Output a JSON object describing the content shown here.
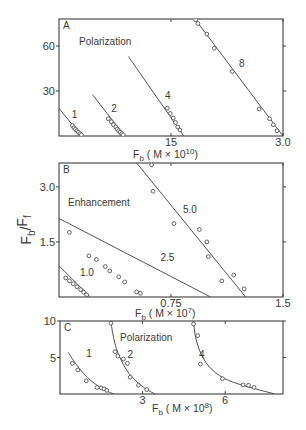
{
  "figure": {
    "ylabel": "Fb/Ff",
    "ylabel_parts": {
      "num": "F",
      "num_sub": "b",
      "den": "F",
      "den_sub": "f"
    }
  },
  "chart_data": [
    {
      "panel": "A",
      "type": "scatter",
      "title": "Polarization",
      "xlabel": "Fb (M x 10^10)",
      "xlabel_parts": {
        "main": "F",
        "sub": "b",
        "rest": "( M × 10",
        "exp": "10",
        "close": ")"
      },
      "ylabel": "Fb/Ff",
      "xlim": [
        0,
        30
      ],
      "ylim": [
        0,
        78
      ],
      "xticks": [
        {
          "v": 15,
          "label": "15"
        },
        {
          "v": 30,
          "label": "3.0"
        }
      ],
      "yticks": [
        {
          "v": 30,
          "label": "30"
        },
        {
          "v": 60,
          "label": "60"
        }
      ],
      "fit": "linear",
      "series": [
        {
          "name": "1",
          "line": [
            [
              0,
              18.5
            ],
            [
              3.0,
              0
            ]
          ],
          "label_at": [
            1.7,
            12
          ],
          "points": [
            [
              1.8,
              7
            ],
            [
              2.0,
              5.5
            ],
            [
              2.2,
              4.5
            ],
            [
              2.4,
              3.5
            ],
            [
              2.6,
              2.5
            ],
            [
              2.8,
              1.5
            ],
            [
              3.0,
              0.8
            ]
          ]
        },
        {
          "name": "2",
          "line": [
            [
              4.5,
              27.5
            ],
            [
              8.8,
              0
            ]
          ],
          "label_at": [
            7.0,
            16
          ],
          "points": [
            [
              6.6,
              11.5
            ],
            [
              7.0,
              9.5
            ],
            [
              7.3,
              7.5
            ],
            [
              7.6,
              6
            ],
            [
              7.8,
              4.5
            ],
            [
              8.0,
              3.5
            ],
            [
              8.2,
              2.5
            ],
            [
              8.4,
              1.5
            ],
            [
              8.6,
              0.8
            ]
          ]
        },
        {
          "name": "4",
          "line": [
            [
              9.3,
              53
            ],
            [
              16.7,
              0
            ]
          ],
          "label_at": [
            14.2,
            25
          ],
          "points": [
            [
              14.5,
              18.5
            ],
            [
              14.9,
              15
            ],
            [
              15.3,
              12
            ],
            [
              15.6,
              9
            ],
            [
              15.9,
              6
            ],
            [
              16.2,
              4
            ]
          ]
        },
        {
          "name": "8",
          "line": [
            [
              18.2,
              78
            ],
            [
              30.0,
              0
            ]
          ],
          "label_at": [
            24.1,
            46
          ],
          "points": [
            [
              18.3,
              77.5
            ],
            [
              18.6,
              75
            ],
            [
              19.8,
              68
            ],
            [
              20.8,
              58.5
            ],
            [
              23.2,
              43
            ],
            [
              26.8,
              18
            ],
            [
              28.2,
              11.5
            ],
            [
              28.7,
              7.5
            ],
            [
              29.2,
              3.5
            ]
          ]
        }
      ]
    },
    {
      "panel": "B",
      "type": "scatter",
      "title": "Enhancement",
      "xlabel": "Fb (M x 10^7)",
      "xlabel_parts": {
        "main": "F",
        "sub": "b",
        "rest": "( M × 10",
        "exp": "7",
        "close": ")"
      },
      "ylabel": "Fb/Ff",
      "xlim": [
        0,
        1.5
      ],
      "ylim": [
        0,
        3.65
      ],
      "xticks": [
        {
          "v": 0.75,
          "label": "0.75"
        },
        {
          "v": 1.5,
          "label": "1.5"
        }
      ],
      "yticks": [
        {
          "v": 1.5,
          "label": "1.5"
        },
        {
          "v": 3.0,
          "label": "3.0"
        }
      ],
      "fit": "linear",
      "series": [
        {
          "name": "1.0",
          "line": [
            [
              0,
              0.85
            ],
            [
              0.21,
              0
            ]
          ],
          "label_at": [
            0.14,
            0.58
          ],
          "points": [
            [
              0.045,
              0.52
            ],
            [
              0.07,
              0.44
            ],
            [
              0.095,
              0.36
            ],
            [
              0.12,
              0.28
            ],
            [
              0.145,
              0.2
            ],
            [
              0.165,
              0.13
            ],
            [
              0.185,
              0.06
            ]
          ]
        },
        {
          "name": "2.5",
          "line": [
            [
              0,
              2.14
            ],
            [
              1.015,
              0
            ]
          ],
          "label_at": [
            0.68,
            0.98
          ],
          "points": [
            [
              0.07,
              1.76
            ],
            [
              0.2,
              1.12
            ],
            [
              0.25,
              1.02
            ],
            [
              0.31,
              0.83
            ],
            [
              0.34,
              0.71
            ],
            [
              0.4,
              0.55
            ],
            [
              0.44,
              0.41
            ],
            [
              0.52,
              0.14
            ],
            [
              0.545,
              0.1
            ]
          ]
        },
        {
          "name": "5.0",
          "line": [
            [
              0.52,
              3.65
            ],
            [
              1.25,
              0
            ]
          ],
          "label_at": [
            0.83,
            2.3
          ],
          "points": [
            [
              0.62,
              3.6
            ],
            [
              0.63,
              2.88
            ],
            [
              0.77,
              2.0
            ],
            [
              0.94,
              1.84
            ],
            [
              0.99,
              1.5
            ],
            [
              1.0,
              1.1
            ],
            [
              1.09,
              0.44
            ],
            [
              1.17,
              0.6
            ],
            [
              1.24,
              0.22
            ]
          ]
        }
      ]
    },
    {
      "panel": "C",
      "type": "scatter",
      "title": "Polarization",
      "xlabel": "Fb (M x 10^8)",
      "xlabel_parts": {
        "main": "F",
        "sub": "b",
        "rest": "( M × 10",
        "exp": "8",
        "close": ")"
      },
      "ylabel": "Fb/Ff",
      "xlim": [
        0,
        8.1
      ],
      "ylim": [
        0,
        10
      ],
      "xticks": [
        {
          "v": 3,
          "label": "3"
        },
        {
          "v": 6,
          "label": "6"
        }
      ],
      "yticks": [
        {
          "v": 5,
          "label": "5"
        },
        {
          "v": 10,
          "label": "10"
        }
      ],
      "fit": "hyperbolic",
      "series": [
        {
          "name": "1",
          "label_at": [
            0.95,
            5.05
          ],
          "curve": [
            [
              0.3,
              5.7
            ],
            [
              0.5,
              4.5
            ],
            [
              0.7,
              3.5
            ],
            [
              0.9,
              2.6
            ],
            [
              1.1,
              1.9
            ],
            [
              1.3,
              1.3
            ],
            [
              1.5,
              0.8
            ],
            [
              1.7,
              0.4
            ],
            [
              1.95,
              0
            ]
          ],
          "points": [
            [
              0.45,
              4.2
            ],
            [
              0.65,
              3.3
            ],
            [
              0.95,
              1.8
            ],
            [
              1.35,
              0.9
            ],
            [
              1.5,
              0.85
            ],
            [
              1.6,
              0.7
            ],
            [
              1.7,
              0.5
            ]
          ]
        },
        {
          "name": "2",
          "label_at": [
            2.45,
            5.0
          ],
          "curve": [
            [
              1.85,
              10
            ],
            [
              1.9,
              8.5
            ],
            [
              2.0,
              6.8
            ],
            [
              2.1,
              5.6
            ],
            [
              2.3,
              4.0
            ],
            [
              2.5,
              2.8
            ],
            [
              2.8,
              1.6
            ],
            [
              3.1,
              0.7
            ],
            [
              3.45,
              0
            ]
          ],
          "points": [
            [
              1.85,
              9.7
            ],
            [
              2.0,
              5.8
            ],
            [
              2.1,
              5.2
            ],
            [
              2.3,
              4.8
            ],
            [
              2.45,
              4.2
            ],
            [
              2.55,
              2.3
            ],
            [
              2.85,
              1.2
            ],
            [
              3.15,
              0.6
            ]
          ]
        },
        {
          "name": "4",
          "label_at": [
            5.05,
            5.0
          ],
          "curve": [
            [
              4.85,
              10
            ],
            [
              4.9,
              8.0
            ],
            [
              5.05,
              6.0
            ],
            [
              5.3,
              4.2
            ],
            [
              5.6,
              3.0
            ],
            [
              6.0,
              2.0
            ],
            [
              6.6,
              1.2
            ],
            [
              7.2,
              0.6
            ],
            [
              7.8,
              0
            ]
          ],
          "points": [
            [
              4.85,
              9.6
            ],
            [
              5.0,
              8.0
            ],
            [
              5.1,
              4.1
            ],
            [
              5.9,
              2.1
            ],
            [
              6.65,
              1.25
            ],
            [
              6.85,
              1.2
            ],
            [
              7.05,
              0.9
            ]
          ]
        }
      ]
    }
  ],
  "panels_layout": [
    {
      "x0": 59,
      "y0": 19,
      "x1": 283,
      "y1": 136
    },
    {
      "x0": 59,
      "y0": 163,
      "x1": 283,
      "y1": 297
    },
    {
      "x0": 60,
      "y0": 321,
      "x1": 283,
      "y1": 394
    }
  ]
}
